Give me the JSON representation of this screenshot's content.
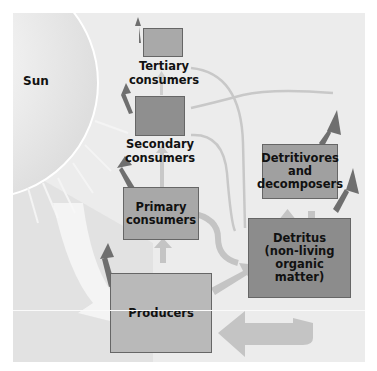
{
  "diagram": {
    "sun_label": "Sun",
    "nodes": {
      "tertiary": {
        "label_line1": "Tertiary",
        "label_line2": "consumers"
      },
      "secondary": {
        "label_line1": "Secondary",
        "label_line2": "consumers"
      },
      "primary": {
        "label_line1": "Primary",
        "label_line2": "consumers"
      },
      "producers": {
        "label": "Producers"
      },
      "detritivores": {
        "label_line1": "Detritivores",
        "label_line2": "and",
        "label_line3": "decomposers"
      },
      "detritus": {
        "label_line1": "Detritus",
        "label_line2": "(non-living organic",
        "label_line3": "matter)"
      }
    },
    "colors": {
      "background": "#ececec",
      "box_light": "#b8b8b8",
      "box_mid": "#a6a6a6",
      "box_dark": "#8f8f8f",
      "arrow_heat": "#6f6f6f",
      "arrow_flow": "#c4c4c4",
      "sunlight": "#f5f5f5"
    }
  }
}
